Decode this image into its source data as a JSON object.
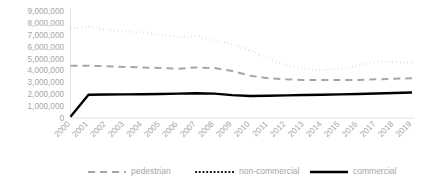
{
  "chart_data": {
    "type": "line",
    "title": "",
    "xlabel": "",
    "ylabel": "",
    "x": [
      "2000",
      "2001",
      "2002",
      "2003",
      "2004",
      "2005",
      "2006",
      "2007",
      "2008",
      "2009",
      "2010",
      "2011",
      "2012",
      "2013",
      "2014",
      "2015",
      "2016",
      "2017",
      "2018",
      "2019"
    ],
    "categories": [
      "2000",
      "2001",
      "2002",
      "2003",
      "2004",
      "2005",
      "2006",
      "2007",
      "2008",
      "2009",
      "2010",
      "2011",
      "2012",
      "2013",
      "2014",
      "2015",
      "2016",
      "2017",
      "2018",
      "2019"
    ],
    "ylim": [
      0,
      9000000
    ],
    "ytick_values": [
      0,
      1000000,
      2000000,
      3000000,
      4000000,
      5000000,
      6000000,
      7000000,
      8000000,
      9000000
    ],
    "ytick_labels": [
      "0",
      "1,000,000",
      "2,000,000",
      "3,000,000",
      "4,000,000",
      "5,000,000",
      "6,000,000",
      "7,000,000",
      "8,000,000",
      "9,000,000"
    ],
    "grid": false,
    "legend_position": "bottom",
    "series": [
      {
        "name": "pedestrian",
        "style": "dashed",
        "color": "#a6a6a6",
        "values": [
          4400000,
          4400000,
          4350000,
          4300000,
          4250000,
          4200000,
          4150000,
          4250000,
          4200000,
          3950000,
          3550000,
          3350000,
          3250000,
          3200000,
          3200000,
          3200000,
          3200000,
          3250000,
          3300000,
          3350000
        ]
      },
      {
        "name": "non-commercial",
        "style": "dotted",
        "color": "#000000",
        "values": [
          7500000,
          7700000,
          7400000,
          7300000,
          7200000,
          7000000,
          6800000,
          6900000,
          6500000,
          6200000,
          5700000,
          5000000,
          4450000,
          4150000,
          4000000,
          4150000,
          4400000,
          4750000,
          4700000,
          4650000
        ]
      },
      {
        "name": "commercial",
        "style": "solid",
        "color": "#000000",
        "values": [
          100000,
          1950000,
          1980000,
          1990000,
          2000000,
          2020000,
          2050000,
          2080000,
          2050000,
          1920000,
          1850000,
          1870000,
          1900000,
          1930000,
          1960000,
          1990000,
          2020000,
          2060000,
          2100000,
          2150000
        ]
      }
    ]
  },
  "legend": {
    "items": [
      {
        "label": "pedestrian"
      },
      {
        "label": "non-commercial"
      },
      {
        "label": "commercial"
      }
    ]
  }
}
